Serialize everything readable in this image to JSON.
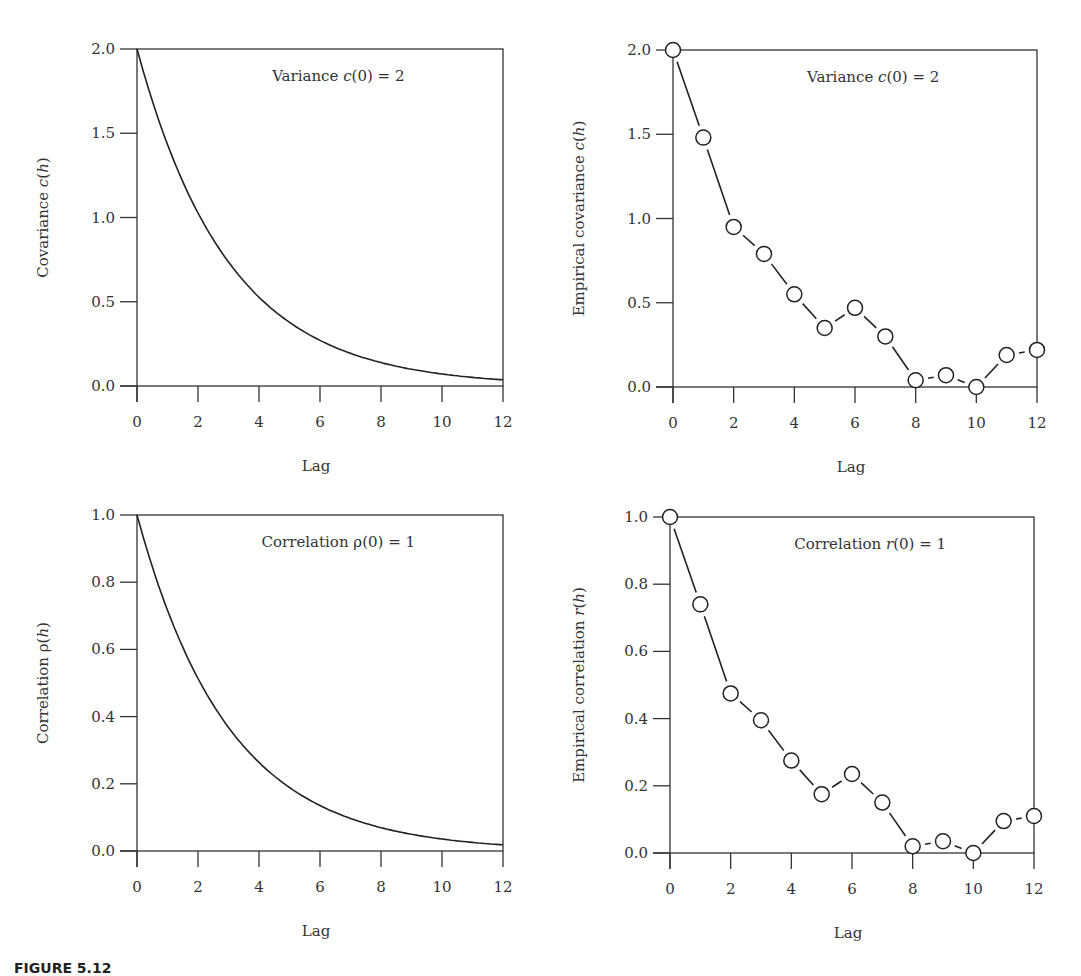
{
  "caption": "FIGURE 5.12",
  "chart_data": [
    {
      "type": "line",
      "title": "",
      "annotation": "Variance c(0) = 2",
      "xlabel": "Lag",
      "ylabel": "Covariance c(h)",
      "xlim": [
        0,
        12
      ],
      "ylim": [
        0,
        2
      ],
      "xticks": [
        "0",
        "2",
        "4",
        "6",
        "8",
        "10",
        "12"
      ],
      "yticks": [
        "0.0",
        "0.5",
        "1.0",
        "1.5",
        "2.0"
      ],
      "grid": false,
      "x": [
        0,
        1,
        2,
        3,
        4,
        5,
        6,
        7,
        8,
        9,
        10,
        11,
        12
      ],
      "series": [
        {
          "name": "Covariance c(h)",
          "style": "solid",
          "values": [
            2.0,
            1.43,
            1.03,
            0.74,
            0.53,
            0.38,
            0.27,
            0.19,
            0.14,
            0.1,
            0.07,
            0.05,
            0.04
          ]
        }
      ]
    },
    {
      "type": "line",
      "title": "",
      "annotation": "Variance c(0) = 2",
      "xlabel": "Lag",
      "ylabel": "Empirical covariance c(h)",
      "xlim": [
        0,
        12
      ],
      "ylim": [
        0,
        2
      ],
      "xticks": [
        "0",
        "2",
        "4",
        "6",
        "8",
        "10",
        "12"
      ],
      "yticks": [
        "0.0",
        "0.5",
        "1.0",
        "1.5",
        "2.0"
      ],
      "grid": false,
      "x": [
        0,
        1,
        2,
        3,
        4,
        5,
        6,
        7,
        8,
        9,
        10,
        11,
        12
      ],
      "series": [
        {
          "name": "Empirical covariance c(h)",
          "style": "dashed-with-open-circles",
          "values": [
            2.0,
            1.48,
            0.95,
            0.79,
            0.55,
            0.35,
            0.47,
            0.3,
            0.04,
            0.07,
            0.0,
            0.19,
            0.22
          ]
        }
      ]
    },
    {
      "type": "line",
      "title": "",
      "annotation": "Correlation ρ(0) = 1",
      "xlabel": "Lag",
      "ylabel": "Correlation ρ(h)",
      "xlim": [
        0,
        12
      ],
      "ylim": [
        0,
        1
      ],
      "xticks": [
        "0",
        "2",
        "4",
        "6",
        "8",
        "10",
        "12"
      ],
      "yticks": [
        "0.0",
        "0.2",
        "0.4",
        "0.6",
        "0.8",
        "1.0"
      ],
      "grid": false,
      "x": [
        0,
        1,
        2,
        3,
        4,
        5,
        6,
        7,
        8,
        9,
        10,
        11,
        12
      ],
      "series": [
        {
          "name": "Correlation ρ(h)",
          "style": "solid",
          "values": [
            1.0,
            0.72,
            0.51,
            0.37,
            0.26,
            0.19,
            0.135,
            0.097,
            0.07,
            0.05,
            0.036,
            0.026,
            0.018
          ]
        }
      ]
    },
    {
      "type": "line",
      "title": "",
      "annotation": "Correlation r(0) = 1",
      "xlabel": "Lag",
      "ylabel": "Empirical correlation r(h)",
      "xlim": [
        0,
        12
      ],
      "ylim": [
        0,
        1
      ],
      "xticks": [
        "0",
        "2",
        "4",
        "6",
        "8",
        "10",
        "12"
      ],
      "yticks": [
        "0.0",
        "0.2",
        "0.4",
        "0.6",
        "0.8",
        "1.0"
      ],
      "grid": false,
      "x": [
        0,
        1,
        2,
        3,
        4,
        5,
        6,
        7,
        8,
        9,
        10,
        11,
        12
      ],
      "series": [
        {
          "name": "Empirical correlation r(h)",
          "style": "dashed-with-open-circles",
          "values": [
            1.0,
            0.74,
            0.475,
            0.395,
            0.275,
            0.175,
            0.235,
            0.15,
            0.02,
            0.035,
            0.0,
            0.095,
            0.11
          ]
        }
      ]
    }
  ],
  "panels": [
    {
      "box": [
        137,
        49,
        503,
        386
      ],
      "ylabel_x": 48
    },
    {
      "box": [
        673,
        50,
        1037,
        387
      ],
      "ylabel_x": 584
    },
    {
      "box": [
        137,
        515,
        503,
        851
      ],
      "ylabel_x": 48
    },
    {
      "box": [
        670,
        517,
        1034,
        853
      ],
      "ylabel_x": 584
    }
  ]
}
